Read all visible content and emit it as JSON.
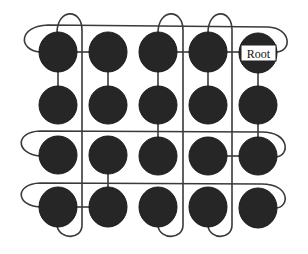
{
  "diagram": {
    "title": "",
    "type": "mesh network with ring buses and root node",
    "grid": {
      "columns": 5,
      "rows": 4
    },
    "root_label": "Root",
    "root_node": {
      "col": 4,
      "row": 0
    },
    "colors": {
      "node_fill": "#262626",
      "wire": "#3a3a3a",
      "label_box": "#ffffff"
    },
    "nodes": [
      {
        "col": 0,
        "row": 0
      },
      {
        "col": 1,
        "row": 0
      },
      {
        "col": 2,
        "row": 0
      },
      {
        "col": 3,
        "row": 0
      },
      {
        "col": 4,
        "row": 0,
        "label": "Root"
      },
      {
        "col": 0,
        "row": 1
      },
      {
        "col": 1,
        "row": 1
      },
      {
        "col": 2,
        "row": 1
      },
      {
        "col": 3,
        "row": 1
      },
      {
        "col": 4,
        "row": 1
      },
      {
        "col": 0,
        "row": 2
      },
      {
        "col": 1,
        "row": 2
      },
      {
        "col": 2,
        "row": 2
      },
      {
        "col": 3,
        "row": 2
      },
      {
        "col": 4,
        "row": 2
      },
      {
        "col": 0,
        "row": 3
      },
      {
        "col": 1,
        "row": 3
      },
      {
        "col": 2,
        "row": 3
      },
      {
        "col": 3,
        "row": 3
      },
      {
        "col": 4,
        "row": 3
      }
    ],
    "links": [
      {
        "from": [
          0,
          0
        ],
        "to": [
          1,
          0
        ]
      },
      {
        "from": [
          2,
          0
        ],
        "to": [
          3,
          0
        ]
      },
      {
        "from": [
          3,
          0
        ],
        "to": [
          4,
          0
        ]
      },
      {
        "from": [
          0,
          0
        ],
        "to": [
          0,
          1
        ]
      },
      {
        "from": [
          1,
          0
        ],
        "to": [
          1,
          1
        ]
      },
      {
        "from": [
          2,
          0
        ],
        "to": [
          2,
          1
        ]
      },
      {
        "from": [
          3,
          0
        ],
        "to": [
          3,
          1
        ]
      },
      {
        "from": [
          4,
          0
        ],
        "to": [
          4,
          1
        ]
      },
      {
        "from": [
          2,
          1
        ],
        "to": [
          2,
          2
        ]
      },
      {
        "from": [
          4,
          1
        ],
        "to": [
          4,
          2
        ]
      },
      {
        "from": [
          3,
          2
        ],
        "to": [
          4,
          2
        ]
      },
      {
        "from": [
          1,
          2
        ],
        "to": [
          1,
          3
        ]
      },
      {
        "from": [
          0,
          3
        ],
        "to": [
          1,
          3
        ]
      }
    ],
    "horizontal_buses": 3,
    "vertical_buses": 3
  }
}
